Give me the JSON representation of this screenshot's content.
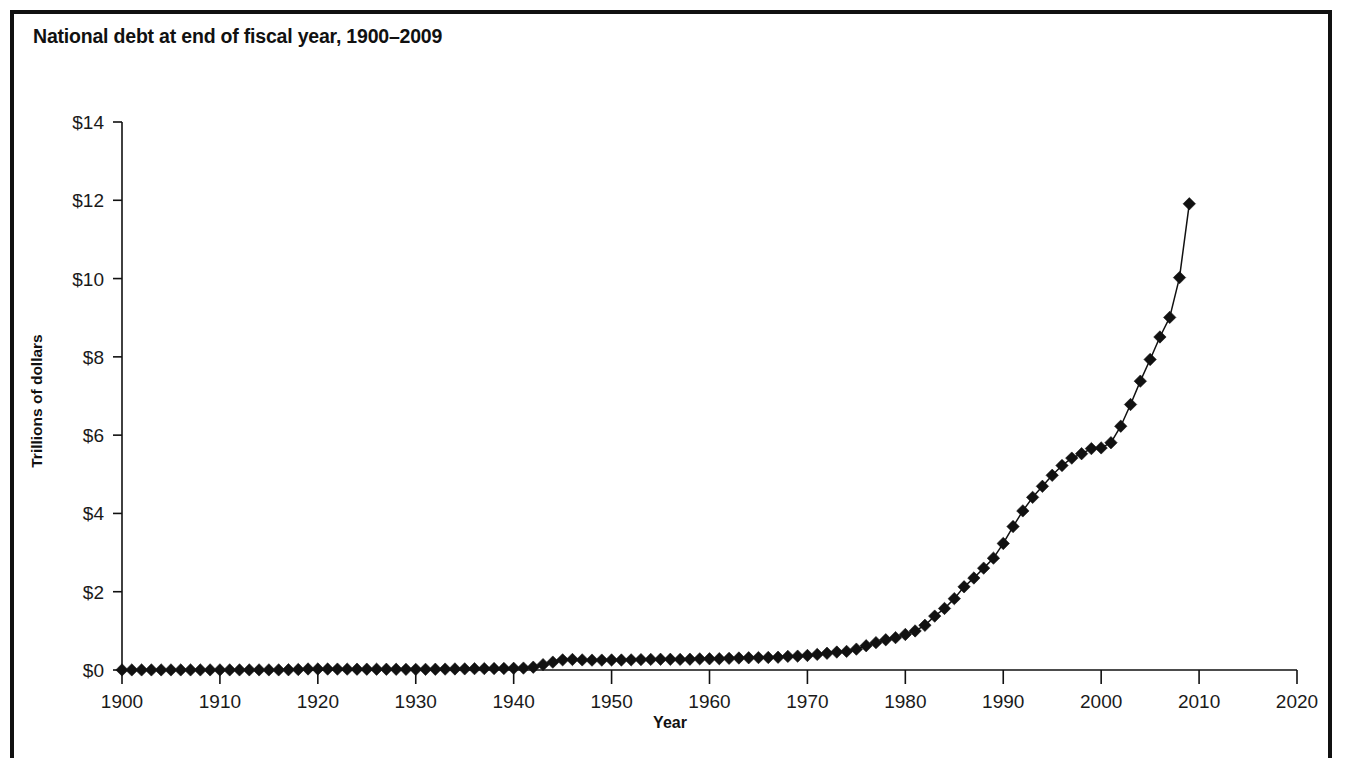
{
  "figure": {
    "title": "National debt at end of fiscal year, 1900–2009",
    "background_color": "#ffffff",
    "border_color": "#111111",
    "ink_color": "#111111"
  },
  "chart_data": {
    "type": "line",
    "title": "National debt at end of fiscal year, 1900–2009",
    "xlabel": "Year",
    "ylabel": "Trillions of dollars",
    "xlim": [
      1900,
      2020
    ],
    "ylim": [
      0,
      14
    ],
    "xticks": [
      1900,
      1910,
      1920,
      1930,
      1940,
      1950,
      1960,
      1970,
      1980,
      1990,
      2000,
      2010,
      2020
    ],
    "xtick_labels": [
      "1900",
      "1910",
      "1920",
      "1930",
      "1940",
      "1950",
      "1960",
      "1970",
      "1980",
      "1990",
      "2000",
      "2010",
      "2020"
    ],
    "yticks": [
      0,
      2,
      4,
      6,
      8,
      10,
      12,
      14
    ],
    "ytick_labels": [
      "$0",
      "$2",
      "$4",
      "$6",
      "$8",
      "$10",
      "$12",
      "$14"
    ],
    "grid": false,
    "legend": false,
    "marker": "diamond",
    "marker_color": "#111111",
    "line_color": "#111111",
    "units": "trillions of dollars",
    "x": [
      1900,
      1901,
      1902,
      1903,
      1904,
      1905,
      1906,
      1907,
      1908,
      1909,
      1910,
      1911,
      1912,
      1913,
      1914,
      1915,
      1916,
      1917,
      1918,
      1919,
      1920,
      1921,
      1922,
      1923,
      1924,
      1925,
      1926,
      1927,
      1928,
      1929,
      1930,
      1931,
      1932,
      1933,
      1934,
      1935,
      1936,
      1937,
      1938,
      1939,
      1940,
      1941,
      1942,
      1943,
      1944,
      1945,
      1946,
      1947,
      1948,
      1949,
      1950,
      1951,
      1952,
      1953,
      1954,
      1955,
      1956,
      1957,
      1958,
      1959,
      1960,
      1961,
      1962,
      1963,
      1964,
      1965,
      1966,
      1967,
      1968,
      1969,
      1970,
      1971,
      1972,
      1973,
      1974,
      1975,
      1976,
      1977,
      1978,
      1979,
      1980,
      1981,
      1982,
      1983,
      1984,
      1985,
      1986,
      1987,
      1988,
      1989,
      1990,
      1991,
      1992,
      1993,
      1994,
      1995,
      1996,
      1997,
      1998,
      1999,
      2000,
      2001,
      2002,
      2003,
      2004,
      2005,
      2006,
      2007,
      2008,
      2009
    ],
    "y": [
      0.002,
      0.002,
      0.002,
      0.002,
      0.002,
      0.002,
      0.002,
      0.002,
      0.002,
      0.003,
      0.003,
      0.003,
      0.003,
      0.003,
      0.003,
      0.003,
      0.003,
      0.006,
      0.012,
      0.026,
      0.026,
      0.024,
      0.023,
      0.022,
      0.021,
      0.021,
      0.02,
      0.019,
      0.018,
      0.017,
      0.016,
      0.017,
      0.019,
      0.023,
      0.027,
      0.029,
      0.034,
      0.036,
      0.037,
      0.04,
      0.043,
      0.049,
      0.072,
      0.137,
      0.201,
      0.259,
      0.269,
      0.258,
      0.252,
      0.253,
      0.257,
      0.255,
      0.259,
      0.266,
      0.271,
      0.274,
      0.273,
      0.271,
      0.276,
      0.285,
      0.286,
      0.289,
      0.298,
      0.306,
      0.312,
      0.317,
      0.32,
      0.326,
      0.348,
      0.354,
      0.371,
      0.398,
      0.427,
      0.458,
      0.475,
      0.533,
      0.62,
      0.699,
      0.772,
      0.827,
      0.908,
      0.998,
      1.142,
      1.377,
      1.572,
      1.823,
      2.125,
      2.35,
      2.602,
      2.857,
      3.233,
      3.665,
      4.065,
      4.411,
      4.693,
      4.974,
      5.225,
      5.413,
      5.526,
      5.656,
      5.674,
      5.807,
      6.228,
      6.783,
      7.379,
      7.933,
      8.507,
      9.008,
      10.025,
      11.91
    ],
    "annotations": []
  },
  "axes": {
    "y_title": "Trillions of dollars",
    "x_title": "Year"
  }
}
